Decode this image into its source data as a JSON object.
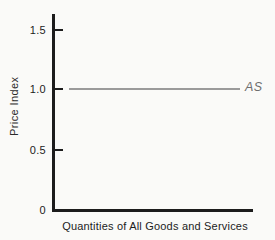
{
  "chart_data": {
    "type": "line",
    "title": "",
    "xlabel": "Quantities of All Goods and Services",
    "ylabel": "Price Index",
    "y_tick_labels": [
      "0",
      "0.5",
      "1.0",
      "1.5"
    ],
    "ylim": [
      0,
      1.75
    ],
    "x_tick_labels": [],
    "grid": false,
    "legend_position": "none",
    "series": [
      {
        "name": "AS",
        "kind": "horizontal-line",
        "y": 1.0,
        "note": "flat aggregate supply curve at price index 1.0, labeled at right end of line"
      }
    ]
  },
  "colors": {
    "background": "#fafaf8",
    "axis": "#1c1c1c",
    "as_line": "#9a9a9a",
    "as_label": "#6e6e6e"
  }
}
